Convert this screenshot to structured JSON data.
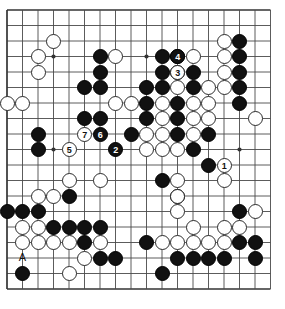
{
  "diagram": {
    "kind": "go-board-diagram",
    "board_size": 19,
    "visible_columns": 18,
    "visible_rows": 19,
    "colors": {
      "background": "#ffffff",
      "grid_line": "#4a4a4a",
      "border_line": "#333333",
      "black_stone": "#111111",
      "white_stone": "#ffffff",
      "white_stone_edge": "#2b2b2b",
      "label_on_black": "#ffffff",
      "label_on_white": "#111111"
    },
    "geometry": {
      "origin_x": 7,
      "origin_y": 10,
      "cell": 15.5,
      "stone_diameter": 15.0,
      "cols": 18,
      "rows": 19
    },
    "star_points": [
      {
        "col": 3,
        "row": 3
      },
      {
        "col": 9,
        "row": 3
      },
      {
        "col": 15,
        "row": 3
      },
      {
        "col": 3,
        "row": 9
      },
      {
        "col": 9,
        "row": 9
      },
      {
        "col": 15,
        "row": 9
      },
      {
        "col": 3,
        "row": 15
      },
      {
        "col": 9,
        "row": 15
      },
      {
        "col": 15,
        "row": 15
      }
    ],
    "black_stones": [
      {
        "col": 6,
        "row": 3
      },
      {
        "col": 6,
        "row": 4
      },
      {
        "col": 5,
        "row": 5
      },
      {
        "col": 6,
        "row": 5
      },
      {
        "col": 10,
        "row": 3
      },
      {
        "col": 11,
        "row": 3
      },
      {
        "col": 15,
        "row": 2
      },
      {
        "col": 15,
        "row": 3
      },
      {
        "col": 15,
        "row": 4
      },
      {
        "col": 15,
        "row": 5
      },
      {
        "col": 10,
        "row": 4
      },
      {
        "col": 11,
        "row": 4
      },
      {
        "col": 12,
        "row": 4
      },
      {
        "col": 9,
        "row": 5
      },
      {
        "col": 10,
        "row": 5
      },
      {
        "col": 12,
        "row": 5
      },
      {
        "col": 9,
        "row": 6
      },
      {
        "col": 11,
        "row": 6
      },
      {
        "col": 15,
        "row": 6
      },
      {
        "col": 9,
        "row": 7
      },
      {
        "col": 11,
        "row": 7
      },
      {
        "col": 8,
        "row": 8
      },
      {
        "col": 11,
        "row": 8
      },
      {
        "col": 13,
        "row": 8
      },
      {
        "col": 2,
        "row": 8
      },
      {
        "col": 2,
        "row": 9
      },
      {
        "col": 5,
        "row": 7
      },
      {
        "col": 6,
        "row": 7
      },
      {
        "col": 12,
        "row": 9
      },
      {
        "col": 13,
        "row": 10
      },
      {
        "col": 10,
        "row": 11
      },
      {
        "col": 11,
        "row": 12
      },
      {
        "col": 4,
        "row": 12
      },
      {
        "col": 0,
        "row": 13
      },
      {
        "col": 1,
        "row": 13
      },
      {
        "col": 2,
        "row": 13
      },
      {
        "col": 15,
        "row": 13
      },
      {
        "col": 3,
        "row": 14
      },
      {
        "col": 4,
        "row": 14
      },
      {
        "col": 5,
        "row": 14
      },
      {
        "col": 6,
        "row": 14
      },
      {
        "col": 5,
        "row": 15
      },
      {
        "col": 9,
        "row": 15
      },
      {
        "col": 15,
        "row": 15
      },
      {
        "col": 16,
        "row": 15
      },
      {
        "col": 6,
        "row": 16
      },
      {
        "col": 7,
        "row": 16
      },
      {
        "col": 11,
        "row": 16
      },
      {
        "col": 12,
        "row": 16
      },
      {
        "col": 13,
        "row": 16
      },
      {
        "col": 14,
        "row": 16
      },
      {
        "col": 16,
        "row": 16
      },
      {
        "col": 1,
        "row": 17
      },
      {
        "col": 10,
        "row": 17
      }
    ],
    "white_stones": [
      {
        "col": 3,
        "row": 2
      },
      {
        "col": 2,
        "row": 3
      },
      {
        "col": 7,
        "row": 3
      },
      {
        "col": 12,
        "row": 3
      },
      {
        "col": 14,
        "row": 2
      },
      {
        "col": 2,
        "row": 4
      },
      {
        "col": 14,
        "row": 3
      },
      {
        "col": 14,
        "row": 4
      },
      {
        "col": 14,
        "row": 5
      },
      {
        "col": 11,
        "row": 5
      },
      {
        "col": 13,
        "row": 5
      },
      {
        "col": 10,
        "row": 6
      },
      {
        "col": 12,
        "row": 6
      },
      {
        "col": 13,
        "row": 6
      },
      {
        "col": 0,
        "row": 6
      },
      {
        "col": 1,
        "row": 6
      },
      {
        "col": 7,
        "row": 6
      },
      {
        "col": 8,
        "row": 6
      },
      {
        "col": 10,
        "row": 7
      },
      {
        "col": 12,
        "row": 7
      },
      {
        "col": 13,
        "row": 7
      },
      {
        "col": 16,
        "row": 7
      },
      {
        "col": 9,
        "row": 8
      },
      {
        "col": 10,
        "row": 8
      },
      {
        "col": 12,
        "row": 8
      },
      {
        "col": 9,
        "row": 9
      },
      {
        "col": 10,
        "row": 9
      },
      {
        "col": 11,
        "row": 9
      },
      {
        "col": 4,
        "row": 11
      },
      {
        "col": 6,
        "row": 11
      },
      {
        "col": 11,
        "row": 11
      },
      {
        "col": 14,
        "row": 11
      },
      {
        "col": 2,
        "row": 12
      },
      {
        "col": 3,
        "row": 12
      },
      {
        "col": 11,
        "row": 12
      },
      {
        "col": 16,
        "row": 13
      },
      {
        "col": 11,
        "row": 13
      },
      {
        "col": 1,
        "row": 14
      },
      {
        "col": 2,
        "row": 14
      },
      {
        "col": 1,
        "row": 15
      },
      {
        "col": 2,
        "row": 15
      },
      {
        "col": 3,
        "row": 15
      },
      {
        "col": 4,
        "row": 15
      },
      {
        "col": 10,
        "row": 15
      },
      {
        "col": 11,
        "row": 15
      },
      {
        "col": 12,
        "row": 14
      },
      {
        "col": 14,
        "row": 14
      },
      {
        "col": 15,
        "row": 14
      },
      {
        "col": 6,
        "row": 15
      },
      {
        "col": 12,
        "row": 15
      },
      {
        "col": 13,
        "row": 15
      },
      {
        "col": 14,
        "row": 15
      },
      {
        "col": 5,
        "row": 16
      },
      {
        "col": 4,
        "row": 17
      }
    ],
    "numbered_moves": [
      {
        "number": "1",
        "color": "white",
        "col": 14,
        "row": 10
      },
      {
        "number": "2",
        "color": "black",
        "col": 7,
        "row": 9
      },
      {
        "number": "3",
        "color": "white",
        "col": 11,
        "row": 4
      },
      {
        "number": "4",
        "color": "black",
        "col": 11,
        "row": 3
      },
      {
        "number": "5",
        "color": "white",
        "col": 4,
        "row": 9
      },
      {
        "number": "6",
        "color": "black",
        "col": 6,
        "row": 8
      },
      {
        "number": "7",
        "color": "white",
        "col": 5,
        "row": 8
      }
    ],
    "letter_markers": [
      {
        "letter": "A",
        "col": 1,
        "row": 16
      }
    ]
  }
}
